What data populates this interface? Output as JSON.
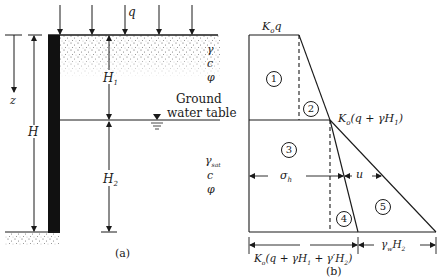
{
  "figure_a": {
    "caption": "(a)",
    "load_label": "q",
    "depth_label": "z",
    "total_height_label": "H",
    "upper_layer_height_label": "H",
    "upper_layer_height_sub": "1",
    "lower_layer_height_label": "H",
    "lower_layer_height_sub": "2",
    "upper_soil": {
      "unit_weight": "γ",
      "cohesion": "c",
      "friction_angle": "φ"
    },
    "lower_soil": {
      "unit_weight": "γ",
      "unit_weight_sub": "sat",
      "cohesion": "c",
      "friction_angle": "φ"
    },
    "water_table_line1": "Ground",
    "water_table_line2": "water table",
    "water_table_icon": "water-table-triangle-icon"
  },
  "figure_b": {
    "caption": "(b)",
    "top_label": "K",
    "top_label_sub": "o",
    "top_label_rest": "q",
    "mid_label": "K",
    "mid_label_sub": "o",
    "mid_label_rest": "(q + γH",
    "mid_label_sub2": "1",
    "mid_label_end": ")",
    "regions": [
      "1",
      "2",
      "3",
      "4",
      "5"
    ],
    "sigma_label": "σ",
    "sigma_sub": "h",
    "u_label": "u",
    "bottom_left_label": "K",
    "bottom_left_sub": "o",
    "bottom_left_rest": "(q + γH",
    "bottom_left_sub2": "1",
    "bottom_left_mid": " + γ′H",
    "bottom_left_sub3": "2",
    "bottom_left_end": ")",
    "bottom_right_label": "γ",
    "bottom_right_sub": "w",
    "bottom_right_rest": "H",
    "bottom_right_sub2": "2"
  }
}
